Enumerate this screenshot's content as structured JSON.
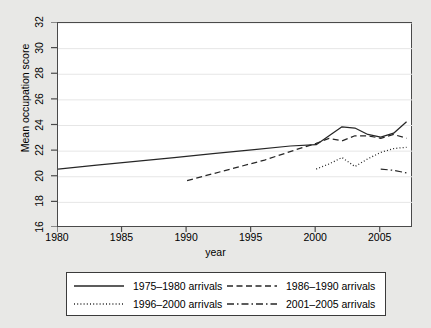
{
  "chart_data": {
    "type": "line",
    "title": "",
    "xlabel": "year",
    "ylabel": "Mean occupation score",
    "xlim": [
      1980,
      2007.5
    ],
    "ylim": [
      16,
      32
    ],
    "xticks": [
      1980,
      1985,
      1990,
      1995,
      2000,
      2005
    ],
    "yticks": [
      16,
      18,
      20,
      22,
      24,
      26,
      28,
      30,
      32
    ],
    "grid": true,
    "legend_position": "below-plot",
    "series": [
      {
        "name": "1975–1980 arrivals",
        "style": "solid",
        "x": [
          1980,
          1983,
          1986,
          1989,
          1992,
          1995,
          1998,
          2000,
          2001,
          2002,
          2003,
          2004,
          2005,
          2006,
          2007
        ],
        "values": [
          20.6,
          20.9,
          21.2,
          21.5,
          21.8,
          22.1,
          22.4,
          22.5,
          23.2,
          23.9,
          23.8,
          23.3,
          23.1,
          23.4,
          24.3
        ]
      },
      {
        "name": "1986–1990 arrivals",
        "style": "dashed",
        "x": [
          1990,
          1993,
          1996,
          1999,
          2000,
          2001,
          2002,
          2003,
          2004,
          2005,
          2006,
          2007
        ],
        "values": [
          19.7,
          20.5,
          21.3,
          22.3,
          22.6,
          23.0,
          22.8,
          23.2,
          23.2,
          23.0,
          23.3,
          23.0
        ]
      },
      {
        "name": "1996–2000 arrivals",
        "style": "dotted",
        "x": [
          2000,
          2001,
          2002,
          2003,
          2004,
          2005,
          2006,
          2007
        ],
        "values": [
          20.6,
          21.0,
          21.5,
          20.8,
          21.4,
          21.9,
          22.2,
          22.3
        ]
      },
      {
        "name": "2001–2005 arrivals",
        "style": "dash-dot",
        "x": [
          2005,
          2006,
          2007
        ],
        "values": [
          20.6,
          20.5,
          20.3
        ]
      }
    ],
    "colors": {
      "line": "#262626",
      "grid": "#e6e6e6",
      "axis": "#4a4a4a",
      "plot_background": "#ffffff",
      "figure_background": "#e8e8e6"
    }
  },
  "axes": {
    "y_title": "Mean occupation score",
    "x_title": "year",
    "y_tick_labels": [
      "16",
      "18",
      "20",
      "22",
      "24",
      "26",
      "28",
      "30",
      "32"
    ],
    "x_tick_labels": [
      "1980",
      "1985",
      "1990",
      "1995",
      "2000",
      "2005"
    ]
  },
  "legend": {
    "entries": [
      {
        "label": "1975–1980 arrivals",
        "style": "solid"
      },
      {
        "label": "1986–1990 arrivals",
        "style": "dashed"
      },
      {
        "label": "1996–2000 arrivals",
        "style": "dotted"
      },
      {
        "label": "2001–2005 arrivals",
        "style": "dash-dot"
      }
    ]
  }
}
